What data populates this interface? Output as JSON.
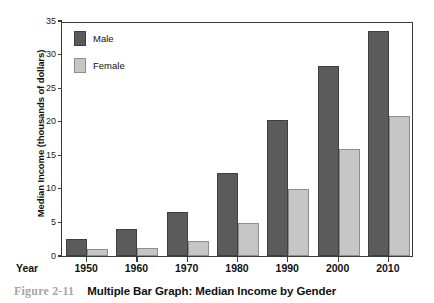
{
  "caption": {
    "number": "Figure 2-11",
    "title": "Multiple Bar Graph: Median Income by Gender"
  },
  "axis": {
    "x_name": "Year"
  },
  "chart_data": {
    "type": "bar",
    "title": "Multiple Bar Graph: Median Income by Gender",
    "xlabel": "Year",
    "ylabel": "Median Income (thousands of dollars)",
    "categories": [
      "1950",
      "1960",
      "1970",
      "1980",
      "1990",
      "2000",
      "2010"
    ],
    "series": [
      {
        "name": "Male",
        "color": "#5b5b5b",
        "values": [
          2.5,
          4.0,
          6.6,
          12.4,
          20.2,
          28.3,
          33.5
        ]
      },
      {
        "name": "Female",
        "color": "#c6c6c6",
        "values": [
          1.0,
          1.2,
          2.2,
          4.9,
          10.0,
          16.0,
          20.9
        ]
      }
    ],
    "ylim": [
      0,
      35
    ],
    "yticks": [
      0,
      5,
      10,
      15,
      20,
      25,
      30,
      35
    ],
    "grid": false,
    "legend_position": "top-left"
  }
}
